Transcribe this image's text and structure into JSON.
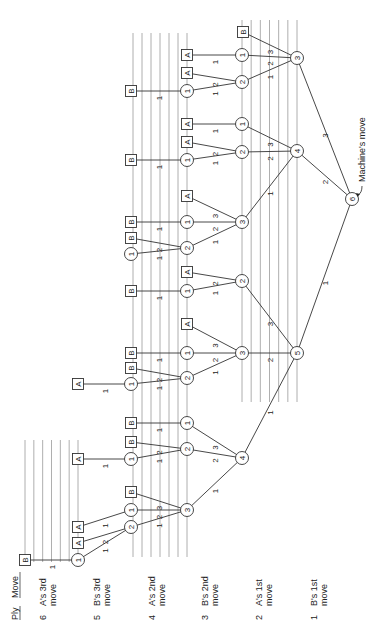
{
  "diagram": {
    "header": {
      "ply_label": "Ply",
      "move_label": "Move"
    },
    "ply_labels": [
      {
        "ply": "6",
        "line1": "A's 3rd",
        "line2": "move",
        "x": 46
      },
      {
        "ply": "5",
        "line1": "B's 3rd",
        "line2": "move",
        "x": 100
      },
      {
        "ply": "4",
        "line1": "A's 2nd",
        "line2": "move",
        "x": 155
      },
      {
        "ply": "3",
        "line1": "B's 2nd",
        "line2": "move",
        "x": 208
      },
      {
        "ply": "2",
        "line1": "A's 1st",
        "line2": "move",
        "x": 262
      },
      {
        "ply": "1",
        "line1": "B's 1st",
        "line2": "move",
        "x": 317
      }
    ],
    "annotation": {
      "text": "Machine's move"
    },
    "guide_groups": [
      {
        "x_start": 25,
        "x_end": 78,
        "count": 7,
        "y_top": 440,
        "y_bottom": 562
      },
      {
        "x_start": 133,
        "x_end": 187,
        "count": 7,
        "y_top": 33,
        "y_bottom": 557
      },
      {
        "x_start": 242,
        "x_end": 297,
        "count": 7,
        "y_top": 20,
        "y_bottom": 402
      }
    ],
    "nodes": [
      {
        "id": "r",
        "type": "circle",
        "label": "6",
        "x": 352,
        "y": 199
      },
      {
        "id": "a5",
        "type": "circle",
        "label": "5",
        "x": 297,
        "y": 353
      },
      {
        "id": "a4",
        "type": "circle",
        "label": "4",
        "x": 297,
        "y": 151
      },
      {
        "id": "a3",
        "type": "circle",
        "label": "3",
        "x": 297,
        "y": 58
      },
      {
        "id": "b1",
        "type": "circle",
        "label": "4",
        "x": 242,
        "y": 458
      },
      {
        "id": "b2",
        "type": "circle",
        "label": "3",
        "x": 242,
        "y": 353
      },
      {
        "id": "b3",
        "type": "circle",
        "label": "2",
        "x": 242,
        "y": 281
      },
      {
        "id": "b4",
        "type": "circle",
        "label": "3",
        "x": 242,
        "y": 222
      },
      {
        "id": "b5",
        "type": "circle",
        "label": "2",
        "x": 242,
        "y": 152
      },
      {
        "id": "b6",
        "type": "circle",
        "label": "1",
        "x": 242,
        "y": 124
      },
      {
        "id": "b7",
        "type": "circle",
        "label": "2",
        "x": 242,
        "y": 82
      },
      {
        "id": "b8",
        "type": "circle",
        "label": "1",
        "x": 242,
        "y": 55
      },
      {
        "id": "b9",
        "type": "box",
        "label": "B",
        "x": 243,
        "y": 32
      },
      {
        "id": "c1",
        "type": "circle",
        "label": "3",
        "x": 187,
        "y": 510
      },
      {
        "id": "c2",
        "type": "circle",
        "label": "2",
        "x": 187,
        "y": 449
      },
      {
        "id": "c3",
        "type": "circle",
        "label": "1",
        "x": 187,
        "y": 423
      },
      {
        "id": "c4",
        "type": "circle",
        "label": "2",
        "x": 187,
        "y": 378
      },
      {
        "id": "c5",
        "type": "circle",
        "label": "1",
        "x": 187,
        "y": 353
      },
      {
        "id": "c6",
        "type": "box",
        "label": "A",
        "x": 187,
        "y": 324
      },
      {
        "id": "c7",
        "type": "circle",
        "label": "1",
        "x": 187,
        "y": 291
      },
      {
        "id": "c8",
        "type": "box",
        "label": "A",
        "x": 187,
        "y": 272
      },
      {
        "id": "c9",
        "type": "circle",
        "label": "2",
        "x": 187,
        "y": 248
      },
      {
        "id": "c10",
        "type": "circle",
        "label": "1",
        "x": 187,
        "y": 222
      },
      {
        "id": "c11",
        "type": "box",
        "label": "A",
        "x": 187,
        "y": 196
      },
      {
        "id": "c12",
        "type": "circle",
        "label": "1",
        "x": 187,
        "y": 160
      },
      {
        "id": "c13",
        "type": "box",
        "label": "A",
        "x": 187,
        "y": 142
      },
      {
        "id": "c14",
        "type": "box",
        "label": "A",
        "x": 187,
        "y": 124
      },
      {
        "id": "c15",
        "type": "circle",
        "label": "1",
        "x": 187,
        "y": 91
      },
      {
        "id": "c16",
        "type": "box",
        "label": "A",
        "x": 187,
        "y": 73
      },
      {
        "id": "c17",
        "type": "box",
        "label": "A",
        "x": 187,
        "y": 55
      },
      {
        "id": "d1",
        "type": "circle",
        "label": "2",
        "x": 131,
        "y": 527
      },
      {
        "id": "d2",
        "type": "circle",
        "label": "1",
        "x": 131,
        "y": 510
      },
      {
        "id": "d3",
        "type": "box",
        "label": "B",
        "x": 131,
        "y": 492
      },
      {
        "id": "d4",
        "type": "circle",
        "label": "1",
        "x": 131,
        "y": 459
      },
      {
        "id": "d5",
        "type": "box",
        "label": "B",
        "x": 131,
        "y": 442
      },
      {
        "id": "d6",
        "type": "box",
        "label": "B",
        "x": 131,
        "y": 423
      },
      {
        "id": "d7",
        "type": "circle",
        "label": "1",
        "x": 131,
        "y": 384
      },
      {
        "id": "d8",
        "type": "box",
        "label": "B",
        "x": 131,
        "y": 368
      },
      {
        "id": "d9",
        "type": "box",
        "label": "B",
        "x": 131,
        "y": 353
      },
      {
        "id": "d10",
        "type": "box",
        "label": "B",
        "x": 131,
        "y": 291
      },
      {
        "id": "d11",
        "type": "circle",
        "label": "1",
        "x": 131,
        "y": 254
      },
      {
        "id": "d12",
        "type": "box",
        "label": "B",
        "x": 131,
        "y": 238
      },
      {
        "id": "d13",
        "type": "box",
        "label": "B",
        "x": 131,
        "y": 222
      },
      {
        "id": "d14",
        "type": "box",
        "label": "B",
        "x": 131,
        "y": 160
      },
      {
        "id": "d15",
        "type": "box",
        "label": "B",
        "x": 131,
        "y": 91
      },
      {
        "id": "e1",
        "type": "circle",
        "label": "1",
        "x": 78,
        "y": 560
      },
      {
        "id": "e2",
        "type": "box",
        "label": "A",
        "x": 78,
        "y": 543
      },
      {
        "id": "e3",
        "type": "box",
        "label": "A",
        "x": 78,
        "y": 527
      },
      {
        "id": "e4",
        "type": "box",
        "label": "A",
        "x": 78,
        "y": 459
      },
      {
        "id": "e5",
        "type": "box",
        "label": "A",
        "x": 78,
        "y": 384
      },
      {
        "id": "f1",
        "type": "box",
        "label": "B",
        "x": 25,
        "y": 560
      }
    ],
    "edges": [
      {
        "from": "r",
        "to": "a5",
        "label": "1"
      },
      {
        "from": "r",
        "to": "a4",
        "label": "2"
      },
      {
        "from": "r",
        "to": "a3",
        "label": "3"
      },
      {
        "from": "a5",
        "to": "b1",
        "label": "1"
      },
      {
        "from": "a5",
        "to": "b2",
        "label": "2"
      },
      {
        "from": "a5",
        "to": "b3",
        "label": "3"
      },
      {
        "from": "a4",
        "to": "b4",
        "label": "1"
      },
      {
        "from": "a4",
        "to": "b5",
        "label": "2"
      },
      {
        "from": "a4",
        "to": "b6",
        "label": "3"
      },
      {
        "from": "a3",
        "to": "b7",
        "label": "1"
      },
      {
        "from": "a3",
        "to": "b8",
        "label": "2"
      },
      {
        "from": "a3",
        "to": "b9",
        "label": "3"
      },
      {
        "from": "b1",
        "to": "c1",
        "label": "1"
      },
      {
        "from": "b1",
        "to": "c2",
        "label": "2"
      },
      {
        "from": "b1",
        "to": "c3",
        "label": "3"
      },
      {
        "from": "b2",
        "to": "c4",
        "label": "1"
      },
      {
        "from": "b2",
        "to": "c5",
        "label": "2"
      },
      {
        "from": "b2",
        "to": "c6",
        "label": "3"
      },
      {
        "from": "b3",
        "to": "c7",
        "label": "1"
      },
      {
        "from": "b3",
        "to": "c8",
        "label": "2"
      },
      {
        "from": "b4",
        "to": "c9",
        "label": "1"
      },
      {
        "from": "b4",
        "to": "c10",
        "label": "2"
      },
      {
        "from": "b4",
        "to": "c11",
        "label": "3"
      },
      {
        "from": "b5",
        "to": "c12",
        "label": "1"
      },
      {
        "from": "b5",
        "to": "c13",
        "label": "2"
      },
      {
        "from": "b6",
        "to": "c14",
        "label": "1"
      },
      {
        "from": "b7",
        "to": "c15",
        "label": "1"
      },
      {
        "from": "b7",
        "to": "c16",
        "label": "2"
      },
      {
        "from": "b8",
        "to": "c17",
        "label": "1"
      },
      {
        "from": "c1",
        "to": "d1",
        "label": "1"
      },
      {
        "from": "c1",
        "to": "d2",
        "label": "2"
      },
      {
        "from": "c1",
        "to": "d3",
        "label": "3"
      },
      {
        "from": "c2",
        "to": "d4",
        "label": "1"
      },
      {
        "from": "c2",
        "to": "d5",
        "label": "2"
      },
      {
        "from": "c3",
        "to": "d6",
        "label": "1"
      },
      {
        "from": "c4",
        "to": "d7",
        "label": "1"
      },
      {
        "from": "c4",
        "to": "d8",
        "label": "2"
      },
      {
        "from": "c5",
        "to": "d9",
        "label": "1"
      },
      {
        "from": "c7",
        "to": "d10",
        "label": "1"
      },
      {
        "from": "c9",
        "to": "d11",
        "label": "1"
      },
      {
        "from": "c9",
        "to": "d12",
        "label": "2"
      },
      {
        "from": "c10",
        "to": "d13",
        "label": "1"
      },
      {
        "from": "c12",
        "to": "d14",
        "label": "1"
      },
      {
        "from": "c15",
        "to": "d15",
        "label": "1"
      },
      {
        "from": "d1",
        "to": "e1",
        "label": "1"
      },
      {
        "from": "d1",
        "to": "e2",
        "label": "2"
      },
      {
        "from": "d2",
        "to": "e3",
        "label": "1"
      },
      {
        "from": "d4",
        "to": "e4",
        "label": "1"
      },
      {
        "from": "d7",
        "to": "e5",
        "label": "1"
      },
      {
        "from": "e1",
        "to": "f1",
        "label": "1"
      }
    ]
  }
}
